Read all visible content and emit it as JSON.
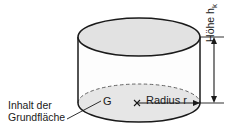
{
  "figure": {
    "type": "geometry-diagram",
    "shape": "cylinder",
    "language": "de",
    "colors": {
      "outline": "#1a1a1a",
      "top_face_fill": "#e2e2e2",
      "bottom_face_fill": "#e6e6e6",
      "body_fill": "#fdfdfd",
      "background": "#ffffff",
      "text": "#1a1a1a",
      "dimension_line": "#1a1a1a",
      "hidden_edge": "#555555"
    }
  },
  "labels": {
    "base_area_line1": "Inhalt der",
    "base_area_line2": "Grundfläche",
    "base_area_symbol": "G",
    "radius": "Radius r",
    "height_text": "Höhe h",
    "height_subscript": "k"
  },
  "geometry": {
    "cylinder_left_x": 78,
    "cylinder_right_x": 200,
    "top_ellipse_cy": 37,
    "bottom_ellipse_cy": 103,
    "ellipse_rx": 61,
    "ellipse_ry": 19,
    "center_marker_x": 137,
    "center_marker_y": 103,
    "dimension_line_x": 214,
    "dimension_top_y": 37,
    "dimension_bottom_y": 103
  }
}
